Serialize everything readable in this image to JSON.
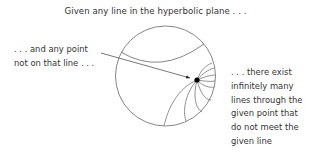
{
  "title": "Given any line in the hyperbolic plane . . .",
  "left_caption": {
    "lines": [
      ". . . and any point",
      "not on that line . . ."
    ]
  },
  "right_caption": {
    "lines": [
      ". . . there exist",
      "infinitely many",
      "lines through the",
      "given point that",
      "do not meet the",
      "given line"
    ]
  },
  "diagram": {
    "model": "Poincare disk",
    "stroke_color": "#777777",
    "point_color": "#000000",
    "elements": [
      "boundary-circle",
      "given-line",
      "given-point",
      "arrow-to-point",
      "parallel-lines"
    ]
  }
}
